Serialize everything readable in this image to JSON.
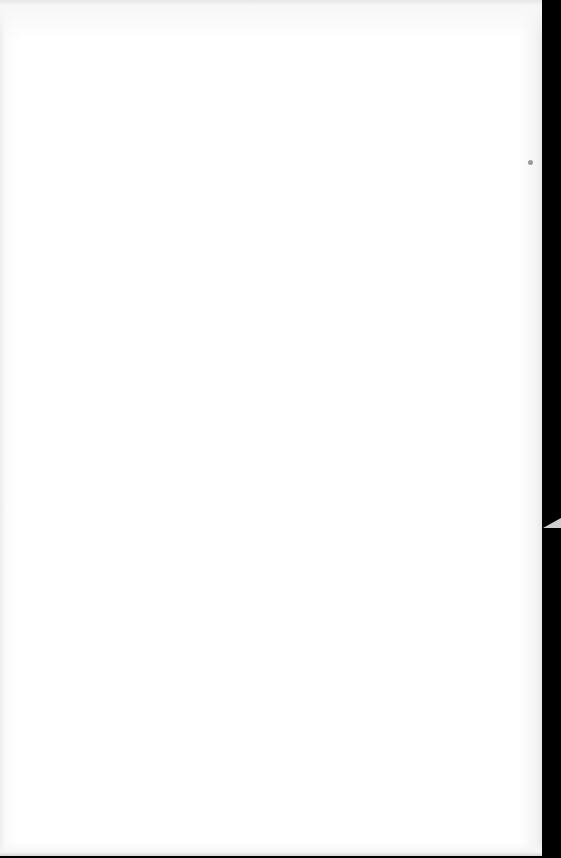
{
  "document": {
    "type": "scanned-blank-page",
    "content_text": "",
    "bleed_through_visible": true
  },
  "colors": {
    "page": "#ffffff",
    "scan_edge": "#000000",
    "speck": "#9a9a9a"
  }
}
